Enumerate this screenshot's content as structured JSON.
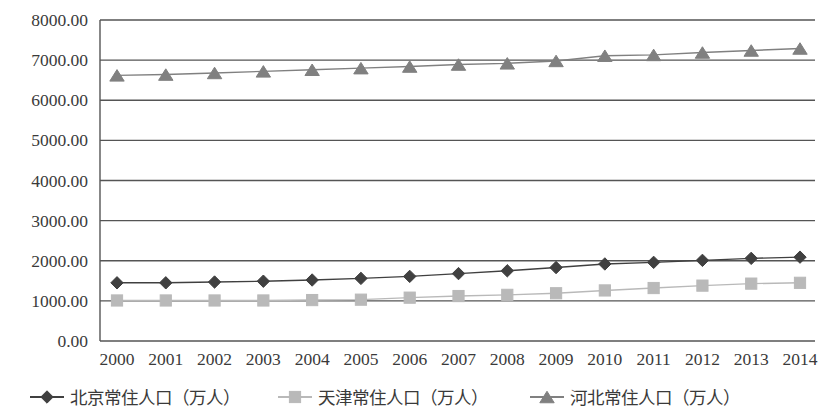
{
  "chart_data": {
    "type": "line",
    "title": "",
    "subtitle": "",
    "xlabel": "",
    "ylabel": "",
    "categories": [
      "2000",
      "2001",
      "2002",
      "2003",
      "2004",
      "2005",
      "2006",
      "2007",
      "2008",
      "2009",
      "2010",
      "2011",
      "2012",
      "2013",
      "2014"
    ],
    "ylim": [
      0,
      8000
    ],
    "ytick_labels": [
      "8000.00",
      "7000.00",
      "6000.00",
      "5000.00",
      "4000.00",
      "3000.00",
      "2000.00",
      "1000.00",
      "0.00"
    ],
    "ytick_values": [
      8000,
      7000,
      6000,
      5000,
      4000,
      3000,
      2000,
      1000,
      0
    ],
    "grid": true,
    "grid_axis": "y",
    "legend_position": "bottom",
    "series": [
      {
        "name": "北京常住人口（万人）",
        "marker": "diamond",
        "color": "#404040",
        "values": [
          1450,
          1450,
          1470,
          1490,
          1520,
          1560,
          1610,
          1680,
          1750,
          1830,
          1920,
          1960,
          2010,
          2060,
          2090
        ]
      },
      {
        "name": "天津常住人口（万人）",
        "marker": "square",
        "color": "#b9b9b9",
        "values": [
          1010,
          1010,
          1010,
          1010,
          1020,
          1030,
          1080,
          1120,
          1150,
          1190,
          1260,
          1320,
          1380,
          1430,
          1450
        ]
      },
      {
        "name": "河北常住人口（万人）",
        "marker": "triangle",
        "color": "#808080",
        "values": [
          6620,
          6640,
          6680,
          6720,
          6760,
          6800,
          6840,
          6890,
          6920,
          6980,
          7110,
          7130,
          7190,
          7240,
          7290
        ]
      }
    ]
  },
  "legend": {
    "items": [
      {
        "label": "北京常住人口（万人）",
        "marker": "diamond",
        "color": "#404040"
      },
      {
        "label": "天津常住人口（万人）",
        "marker": "square",
        "color": "#b9b9b9"
      },
      {
        "label": "河北常住人口（万人）",
        "marker": "triangle",
        "color": "#808080"
      }
    ]
  },
  "axes": {
    "y_top_label": "8000.00",
    "y_bottom_label": "0.00",
    "x_first_label": "2000",
    "x_last_label": "2014"
  }
}
